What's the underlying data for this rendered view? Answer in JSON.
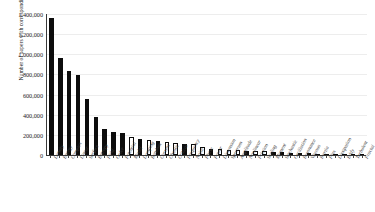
{
  "chart_data": {
    "type": "bar",
    "title": "",
    "xlabel": "",
    "ylabel": "Number of papers with corresponding term in title",
    "ylim": [
      0,
      1400000
    ],
    "ytick_labels": [
      "1,400,000",
      "1,200,000",
      "1,000,000",
      "800,000",
      "600,000",
      "400,000",
      "200,000",
      "0"
    ],
    "ytick_values": [
      1400000,
      1200000,
      1000000,
      800000,
      600000,
      400000,
      200000,
      0
    ],
    "grid": true,
    "legend": "none",
    "bar_fill_styles": [
      "filled",
      "hollow"
    ],
    "categories": [
      "Density",
      "Energy",
      "Complex",
      "Linear",
      "Surface",
      "Entropy",
      "Field",
      "Order",
      "Potential",
      "Model",
      "Damping",
      "Random",
      "Current",
      "Chaotic",
      "Critical",
      "Frequency",
      "Noise",
      "Phase",
      "Power",
      "Dimension",
      "Spectrum",
      "Amplitude",
      "Nonlinear",
      "Friction",
      "Scaling",
      "Moment",
      "Stochastic",
      "Oscillation",
      "Resonance",
      "Viscous",
      "Inertia",
      "Flux",
      "Dissipation",
      "Eddy",
      "Turbulent",
      "Fractal"
    ],
    "values": [
      1360000,
      960000,
      830000,
      790000,
      555000,
      375000,
      255000,
      225000,
      215000,
      175000,
      162000,
      150000,
      140000,
      130000,
      120000,
      112000,
      105000,
      78000,
      62000,
      58000,
      54000,
      50000,
      44000,
      40000,
      36000,
      30000,
      26000,
      22000,
      19000,
      16000,
      13000,
      11000,
      9000,
      7000,
      5000,
      3000
    ],
    "fills": [
      "filled",
      "filled",
      "filled",
      "filled",
      "filled",
      "filled",
      "filled",
      "filled",
      "filled",
      "hollow",
      "filled",
      "hollow",
      "filled",
      "hollow",
      "hollow",
      "filled",
      "hollow",
      "hollow",
      "filled",
      "hollow",
      "hollow",
      "hollow",
      "filled",
      "hollow",
      "hollow",
      "filled",
      "filled",
      "hollow",
      "filled",
      "filled",
      "filled",
      "filled",
      "filled",
      "filled",
      "filled",
      "filled"
    ]
  },
  "colors": {
    "bar_fill": "#0d0d0d",
    "bar_hollow": "#ffffff",
    "gridline": "#ededed",
    "axis": "#3a3a3a",
    "text": "#1c1c1c",
    "background": "#ffffff"
  }
}
